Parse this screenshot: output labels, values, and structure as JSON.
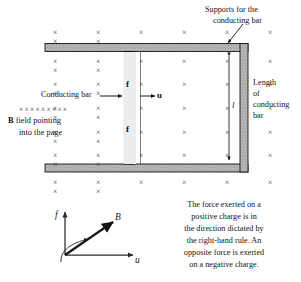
{
  "figure": {
    "background_color": "#ffffff",
    "ink_color": "#141414",
    "rail_fill": "#b4b4b4",
    "bar_fill": "#ededed"
  },
  "annotations": {
    "supports": "Supports for the\nconducting bar",
    "supports_line1": "Supports for the",
    "supports_line2": "conducting bar",
    "conducting_bar": "Conducting bar",
    "b_field_xrow": "×××××××××",
    "b_field_line1_bold": "B",
    "b_field_line1_rest": " field pointing",
    "b_field_line2": "into the page",
    "length_line1": "Length",
    "length_line2": "of",
    "length_line3": "conducting",
    "length_line4": "bar",
    "length_symbol": "l"
  },
  "bar_labels": {
    "positive_charge": "⊕",
    "negative_charge": "⊖",
    "force_top": "f",
    "force_bottom": "f",
    "velocity": "u"
  },
  "caption": {
    "lines": [
      "The force exerted on a",
      "positive charge is in",
      "the direction dictated by",
      "the right-hand rule. An",
      "opposite force is exerted",
      "on a negative charge."
    ],
    "full_text": "The force exerted on a positive charge is in the direction dictated by the right-hand rule. An opposite force is exerted on a negative charge."
  },
  "vector_diagram": {
    "force_label": "f",
    "field_label": "B",
    "velocity_label": "u",
    "rotation_hint": "right-hand-rule-curl"
  },
  "field_grid": {
    "symbol": "×",
    "meaning": "magnetic field into the page",
    "rows_above_top_rail": 1,
    "rows_inside": 5,
    "rows_below_bottom_rail": 1,
    "columns": 8
  }
}
